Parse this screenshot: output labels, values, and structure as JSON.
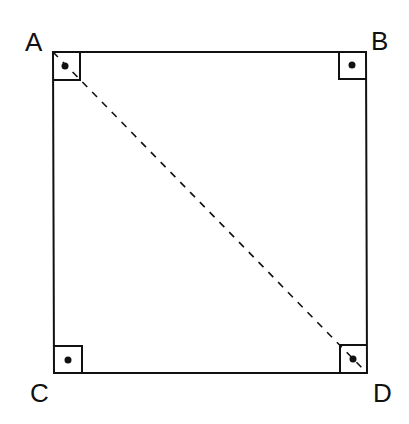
{
  "diagram": {
    "vertices": [
      {
        "label": "A",
        "x": 53,
        "y": 52
      },
      {
        "label": "B",
        "x": 366,
        "y": 52
      },
      {
        "label": "C",
        "x": 54,
        "y": 373
      },
      {
        "label": "D",
        "x": 367,
        "y": 373
      }
    ],
    "diagonal": {
      "from": "A",
      "to": "D",
      "style": "dashed"
    },
    "right_angle_markers": [
      "A",
      "B",
      "C",
      "D"
    ],
    "colors": {
      "stroke": "#111111",
      "background": "#ffffff"
    }
  }
}
